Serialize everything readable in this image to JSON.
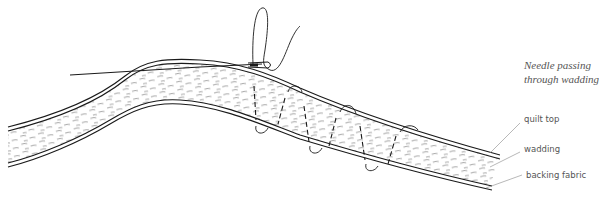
{
  "diagram": {
    "caption_line1": "Needle passing",
    "caption_line2": "through wadding",
    "labels": {
      "quilt_top": "quilt top",
      "wadding": "wadding",
      "backing_fabric": "backing fabric"
    },
    "colors": {
      "ink": "#1a1a1a",
      "fiber": "#6a6a6a",
      "leader": "#888888",
      "text": "#555555",
      "background": "#ffffff"
    }
  }
}
